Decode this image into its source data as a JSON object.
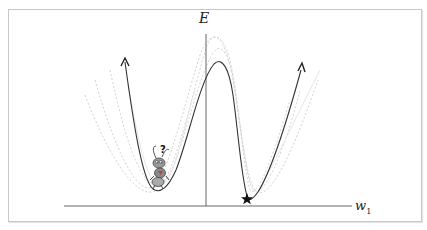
{
  "diagram": {
    "type": "loss-landscape",
    "y_axis_label": "E",
    "x_axis_label": "w",
    "x_axis_subscript": "1",
    "main_curve": {
      "description": "double-well energy curve with arrows at both ends",
      "color": "#333333",
      "left_minimum": "local minimum (ant stuck here)",
      "right_minimum": "global minimum (marked with star)"
    },
    "ghost_curves": {
      "description": "faint dashed alternative curves around main curve",
      "color": "#d6d6d6"
    },
    "markers": {
      "star": "global-minimum-marker",
      "ant": "confused ant character with question mark at local minimum",
      "question_mark": "?"
    },
    "colors": {
      "frame": "#c8c8c8",
      "axis": "#555555",
      "curve": "#333333",
      "ghost": "#d0d0d0",
      "ant_body": "#8a8a8a"
    }
  }
}
